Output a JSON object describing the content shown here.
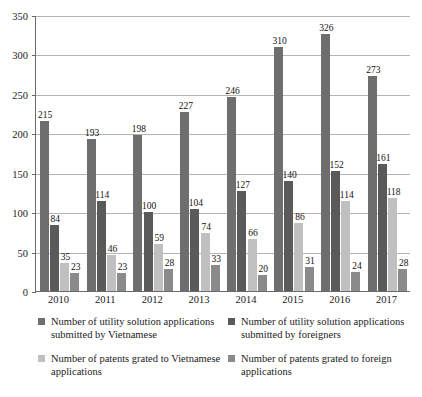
{
  "chart_data": {
    "type": "bar",
    "title": "",
    "subtitle": "",
    "xlabel": "",
    "ylabel": "",
    "ylim": [
      0,
      350
    ],
    "yticks": [
      0,
      50,
      100,
      150,
      200,
      250,
      300,
      350
    ],
    "grid": true,
    "legend_position": "bottom",
    "categories": [
      "2010",
      "2011",
      "2012",
      "2013",
      "2014",
      "2015",
      "2016",
      "2017"
    ],
    "series": [
      {
        "name": "Number of utility solution applications submitted by Vietnamese",
        "color": "#6e6e6e",
        "values": [
          215,
          193,
          198,
          227,
          246,
          310,
          326,
          273
        ]
      },
      {
        "name": "Number of utility solution applications submitted by foreigners",
        "color": "#5a5a5a",
        "values": [
          84,
          114,
          100,
          104,
          127,
          140,
          152,
          161
        ]
      },
      {
        "name": "Number of patents grated to Vietnamese applications",
        "color": "#c0c0c0",
        "values": [
          35,
          46,
          59,
          74,
          66,
          86,
          114,
          118
        ]
      },
      {
        "name": "Number of patents grated to foreign applications",
        "color": "#8a8a8a",
        "values": [
          23,
          23,
          28,
          33,
          20,
          31,
          24,
          28
        ]
      }
    ]
  },
  "legend": {
    "items": [
      {
        "label": "Number of utility solution applications submitted by Vietnamese",
        "swatch": "sw0"
      },
      {
        "label": "Number of utility solution applications submitted by foreigners",
        "swatch": "sw2"
      },
      {
        "label": "Number of patents grated to Vietnamese applications",
        "swatch": "sw1"
      },
      {
        "label": "Number of patents grated to foreign applications",
        "swatch": "sw3"
      }
    ]
  }
}
